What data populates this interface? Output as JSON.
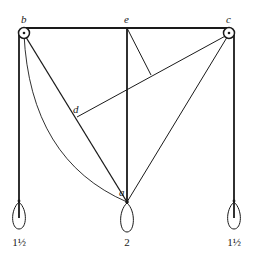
{
  "diagram": {
    "type": "mechanics-pulley-force-diagram",
    "points": {
      "b": {
        "label": "b",
        "desc": "left pulley"
      },
      "c": {
        "label": "c",
        "desc": "right pulley"
      },
      "e": {
        "label": "e",
        "desc": "top midpoint"
      },
      "d": {
        "label": "d",
        "desc": "foot on line ba"
      },
      "a": {
        "label": "a",
        "desc": "knot at center weight"
      }
    },
    "weights": [
      {
        "position": "left",
        "label": "1½"
      },
      {
        "position": "center",
        "label": "2"
      },
      {
        "position": "right",
        "label": "1½"
      }
    ],
    "colors": {
      "line": "#1a1a1a",
      "background": "#ffffff"
    }
  }
}
